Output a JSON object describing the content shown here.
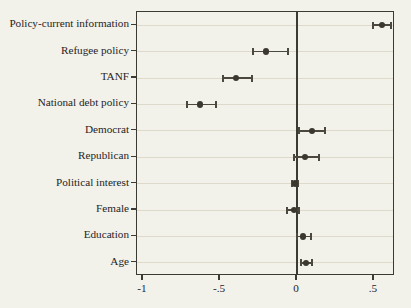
{
  "chart_data": {
    "type": "scatter",
    "title": "",
    "subtitle": "",
    "xlabel": "",
    "ylabel": "",
    "orientation": "horizontal",
    "xlim": [
      -1.15,
      0.636
    ],
    "xticks": [
      -1,
      -0.5,
      0,
      0.5
    ],
    "xticklabels": [
      "-1",
      "-.5",
      "0",
      ".5"
    ],
    "grid": "horizontal",
    "legend": "none",
    "zero_reference_line": 0,
    "categories": [
      "Policy-current information",
      "Refugee policy",
      "TANF",
      "National debt policy",
      "Democrat",
      "Republican",
      "Political interest",
      "Female",
      "Education",
      "Age"
    ],
    "points": [
      {
        "label": "Policy-current information",
        "estimate": 0.552,
        "ci_low": 0.494,
        "ci_high": 0.611
      },
      {
        "label": "Refugee policy",
        "estimate": -0.201,
        "ci_low": -0.286,
        "ci_high": -0.058
      },
      {
        "label": "TANF",
        "estimate": -0.396,
        "ci_low": -0.481,
        "ci_high": -0.292
      },
      {
        "label": "National debt policy",
        "estimate": -0.63,
        "ci_low": -0.714,
        "ci_high": -0.526
      },
      {
        "label": "Democrat",
        "estimate": 0.097,
        "ci_low": 0.013,
        "ci_high": 0.182
      },
      {
        "label": "Republican",
        "estimate": 0.052,
        "ci_low": -0.019,
        "ci_high": 0.143
      },
      {
        "label": "Political interest",
        "estimate": -0.013,
        "ci_low": -0.032,
        "ci_high": 0.006
      },
      {
        "label": "Female",
        "estimate": -0.019,
        "ci_low": -0.065,
        "ci_high": 0.013
      },
      {
        "label": "Education",
        "estimate": 0.039,
        "ci_low": 0.0,
        "ci_high": 0.091
      },
      {
        "label": "Age",
        "estimate": 0.058,
        "ci_low": 0.026,
        "ci_high": 0.097
      }
    ],
    "colors": {
      "marker": "#3a382f",
      "interval": "#4a483f",
      "axis": "#3b3a33",
      "grid": "#ddd9cb",
      "background": "#f2f1ea"
    }
  }
}
